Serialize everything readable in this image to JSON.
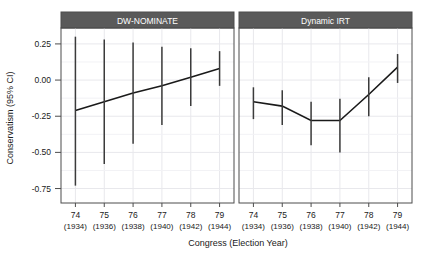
{
  "chart_data": {
    "type": "line",
    "title": "",
    "xlabel": "Congress (Election Year)",
    "ylabel": "Conservatism (95% CI)",
    "ylim": [
      -0.85,
      0.36
    ],
    "yticks": [
      0.25,
      0.0,
      -0.25,
      -0.5,
      -0.75
    ],
    "ytick_labels": [
      "0.25",
      "0.00",
      "-0.25",
      "-0.50",
      "-0.75"
    ],
    "grid": true,
    "legend": "none",
    "categories": [
      "74",
      "75",
      "76",
      "77",
      "78",
      "79"
    ],
    "xtick_labels_top": [
      "74",
      "75",
      "76",
      "77",
      "78",
      "79"
    ],
    "xtick_labels_bottom": [
      "(1934)",
      "(1936)",
      "(1938)",
      "(1940)",
      "(1942)",
      "(1944)"
    ],
    "accent_color": "#1a1a1a",
    "strip_color": "#5a5a5a",
    "grid_color": "#e8e8ec",
    "panels": [
      {
        "label": "DW-NOMINATE",
        "x": [
          "74",
          "75",
          "76",
          "77",
          "78",
          "79"
        ],
        "estimate": [
          -0.21,
          -0.15,
          -0.09,
          -0.04,
          0.02,
          0.08
        ],
        "ci_low": [
          -0.73,
          -0.58,
          -0.44,
          -0.31,
          -0.18,
          -0.04
        ],
        "ci_high": [
          0.3,
          0.28,
          0.26,
          0.23,
          0.22,
          0.2
        ]
      },
      {
        "label": "Dynamic IRT",
        "x": [
          "74",
          "75",
          "76",
          "77",
          "78",
          "79"
        ],
        "estimate": [
          -0.15,
          -0.18,
          -0.28,
          -0.28,
          -0.1,
          0.09
        ],
        "ci_low": [
          -0.27,
          -0.31,
          -0.45,
          -0.5,
          -0.25,
          -0.02
        ],
        "ci_high": [
          -0.05,
          -0.07,
          -0.15,
          -0.13,
          0.02,
          0.18
        ]
      }
    ]
  },
  "axes": {
    "y_title": "Conservatism (95% CI)",
    "x_title": "Congress (Election Year)"
  },
  "panel_strips": {
    "left": "DW-NOMINATE",
    "right": "Dynamic IRT"
  }
}
